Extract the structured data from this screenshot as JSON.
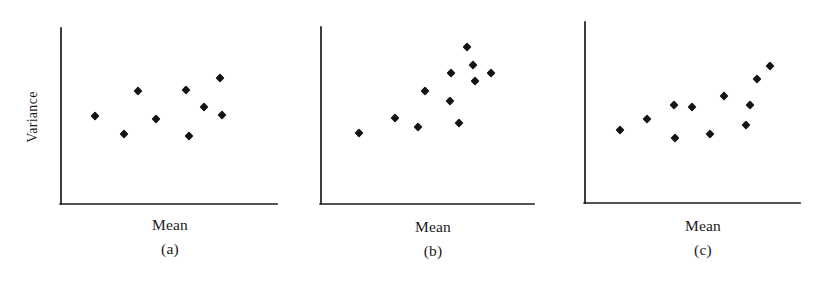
{
  "figure": {
    "background_color": "#ffffff",
    "ink_color": "#1b1b1b",
    "marker_color": "#141414",
    "width": 829,
    "height": 284,
    "y_axis_label": "Variance"
  },
  "chart_data": [
    {
      "type": "scatter",
      "title": "(a)",
      "panel_tag": "(a)",
      "xlabel": "Mean",
      "ylabel": "Variance",
      "grid": false,
      "legend": "none",
      "axes": {
        "x0": 61,
        "y0": 204,
        "x1": 277,
        "y1": 28
      },
      "xlim": [
        61,
        277
      ],
      "ylim": [
        204,
        28
      ],
      "relationship": "no relationship between mean and variance",
      "points": [
        {
          "x": 95,
          "y": 116
        },
        {
          "x": 124,
          "y": 134
        },
        {
          "x": 138,
          "y": 91
        },
        {
          "x": 156,
          "y": 119
        },
        {
          "x": 186,
          "y": 90
        },
        {
          "x": 189,
          "y": 136
        },
        {
          "x": 204,
          "y": 107
        },
        {
          "x": 220,
          "y": 78
        },
        {
          "x": 222,
          "y": 115
        }
      ]
    },
    {
      "type": "scatter",
      "title": "(b)",
      "panel_tag": "(b)",
      "xlabel": "Mean",
      "ylabel": "",
      "grid": false,
      "legend": "none",
      "axes": {
        "x0": 321,
        "y0": 204,
        "x1": 534,
        "y1": 27
      },
      "xlim": [
        321,
        534
      ],
      "ylim": [
        204,
        27
      ],
      "relationship": "variance increases with mean (strong positive)",
      "points": [
        {
          "x": 359,
          "y": 133
        },
        {
          "x": 395,
          "y": 118
        },
        {
          "x": 418,
          "y": 127
        },
        {
          "x": 425,
          "y": 91
        },
        {
          "x": 450,
          "y": 101
        },
        {
          "x": 451,
          "y": 73
        },
        {
          "x": 459,
          "y": 123
        },
        {
          "x": 467,
          "y": 47
        },
        {
          "x": 473,
          "y": 65
        },
        {
          "x": 475,
          "y": 81
        },
        {
          "x": 491,
          "y": 73
        }
      ]
    },
    {
      "type": "scatter",
      "title": "(c)",
      "panel_tag": "(c)",
      "xlabel": "Mean",
      "ylabel": "",
      "grid": false,
      "legend": "none",
      "axes": {
        "x0": 585,
        "y0": 203,
        "x1": 800,
        "y1": 22
      },
      "xlim": [
        585,
        800
      ],
      "ylim": [
        203,
        22
      ],
      "relationship": "variance increases mildly with mean (weak positive)",
      "points": [
        {
          "x": 620,
          "y": 130
        },
        {
          "x": 647,
          "y": 119
        },
        {
          "x": 674,
          "y": 105
        },
        {
          "x": 675,
          "y": 138
        },
        {
          "x": 692,
          "y": 107
        },
        {
          "x": 710,
          "y": 134
        },
        {
          "x": 724,
          "y": 96
        },
        {
          "x": 746,
          "y": 125
        },
        {
          "x": 750,
          "y": 105
        },
        {
          "x": 757,
          "y": 79
        },
        {
          "x": 770,
          "y": 66
        }
      ]
    }
  ],
  "labels": {
    "y_axis": {
      "text": "Variance",
      "x": 33,
      "y": 118
    },
    "x_axes": [
      {
        "text": "Mean",
        "cx": 170,
        "y": 216
      },
      {
        "text": "Mean",
        "cx": 433,
        "y": 218
      },
      {
        "text": "Mean",
        "cx": 703,
        "y": 217
      }
    ],
    "panel_tags": [
      {
        "text": "(a)",
        "cx": 170,
        "y": 240
      },
      {
        "text": "(b)",
        "cx": 433,
        "y": 242
      },
      {
        "text": "(c)",
        "cx": 703,
        "y": 241
      }
    ]
  }
}
